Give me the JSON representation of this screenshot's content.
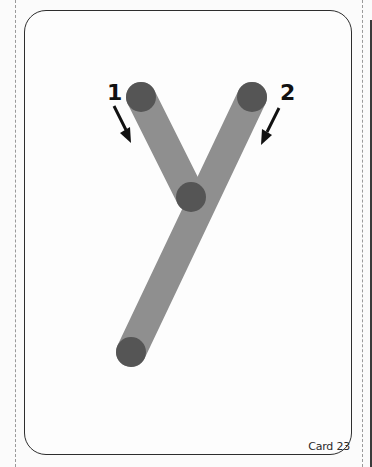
{
  "card": {
    "label": "Card 23",
    "letter": "y"
  },
  "strokes": [
    {
      "number": "1",
      "direction": "down-right",
      "arrow_icon": "arrow-down-right"
    },
    {
      "number": "2",
      "direction": "down-left",
      "arrow_icon": "arrow-down-left"
    }
  ],
  "colors": {
    "stroke_fill": "#8f8f8f",
    "point_fill": "#555555",
    "border": "#2e2e2e",
    "background": "#fdfdfd"
  }
}
